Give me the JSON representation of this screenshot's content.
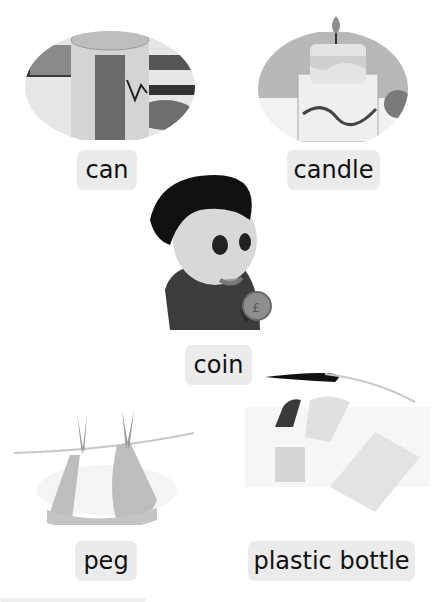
{
  "items": [
    {
      "id": "can",
      "label": "can",
      "image": "can-icon"
    },
    {
      "id": "candle",
      "label": "candle",
      "image": "candle-icon"
    },
    {
      "id": "coin",
      "label": "coin",
      "image": "boy-holding-coin-icon"
    },
    {
      "id": "peg",
      "label": "peg",
      "image": "peg-icon"
    },
    {
      "id": "plastic-bottle",
      "label": "plastic bottle",
      "image": "plastic-bottle-icon"
    }
  ]
}
